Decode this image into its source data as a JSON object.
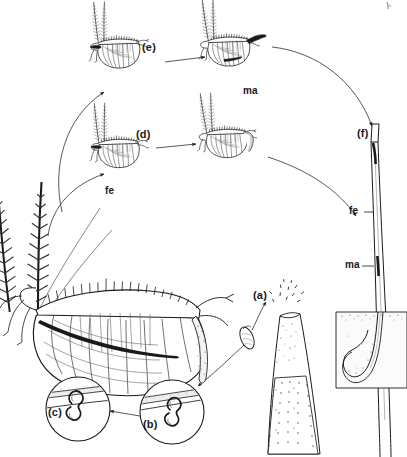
{
  "figure": {
    "type": "scientific-line-illustration",
    "background_color": "#ffffff",
    "ink_color": "#1a1a1a",
    "width": 407,
    "height": 457
  },
  "labels": {
    "stage_a": "(a)",
    "stage_b": "(b)",
    "stage_c": "(c)",
    "stage_d": "(d)",
    "stage_e": "(e)",
    "stage_f": "(f)",
    "male_upper": "ma",
    "male_shaft": "ma",
    "female_lower": "fe",
    "female_shaft": "fe"
  },
  "label_meanings": {
    "ma": "male",
    "fe": "female"
  },
  "stages": [
    {
      "key": "a",
      "label": "(a)",
      "caption": "egg / capsule released at shaft tip"
    },
    {
      "key": "b",
      "label": "(b)",
      "caption": "larva attached to shaft, inset detail"
    },
    {
      "key": "c",
      "label": "(c)",
      "caption": "larva attached to shaft, inset detail"
    },
    {
      "key": "d",
      "label": "(d)",
      "caption": "female adult stage pair"
    },
    {
      "key": "e",
      "label": "(e)",
      "caption": "male adult stage pair"
    },
    {
      "key": "f",
      "label": "(f)",
      "caption": "shaft with female and male in situ"
    }
  ],
  "elements": {
    "central_specimen": "large adult specimen with plumed antennae",
    "insets": [
      "(c)",
      "(b)"
    ],
    "shaft_right": "hair shaft bearing fe and ma",
    "follicle": "hair follicle embedded in skin cross-section",
    "quill": "feather quill / hair shaft with egg (a)"
  }
}
